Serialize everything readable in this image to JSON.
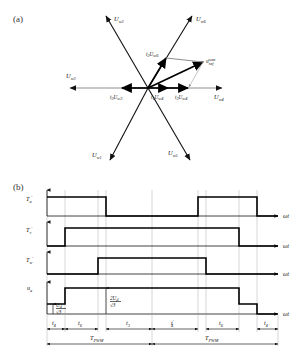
{
  "figure": {
    "panel_a_label": "(a)",
    "panel_b_label": "(b)"
  },
  "vector_diagram": {
    "axis_vectors": [
      {
        "id": "Uw1",
        "base": "U",
        "sub": "w1",
        "angle_deg": 240,
        "label": "U w1"
      },
      {
        "id": "Uw2",
        "base": "U",
        "sub": "w2",
        "angle_deg": 120,
        "label": "U w2"
      },
      {
        "id": "Uw3",
        "base": "U",
        "sub": "w3",
        "angle_deg": 180,
        "label": "U w3"
      },
      {
        "id": "Uw4",
        "base": "U",
        "sub": "w4",
        "angle_deg": 0,
        "label": "U w4"
      },
      {
        "id": "Uw5",
        "base": "U",
        "sub": "w5",
        "angle_deg": 300,
        "label": "U w5"
      },
      {
        "id": "Uw6",
        "base": "U",
        "sub": "w6",
        "angle_deg": 60,
        "label": "U w6"
      }
    ],
    "component_vectors": [
      {
        "id": "t2Uw6",
        "t": "t",
        "t_sub": "2",
        "u": "U",
        "u_sub": "w6",
        "label": "t2 Uw6"
      },
      {
        "id": "t1Uw4",
        "t": "t",
        "t_sub": "1",
        "u": "U",
        "u_sub": "w4",
        "label": "t1 Uw4"
      },
      {
        "id": "t3Uw4",
        "t": "t",
        "t_sub": "3",
        "u": "U",
        "u_sub": "w4",
        "label": "t3 Uw4"
      },
      {
        "id": "t3Uw3",
        "t": "t",
        "t_sub": "3",
        "u": "U",
        "u_sub": "w3",
        "label": "t3 Uw3"
      }
    ],
    "reference_vector": {
      "base": "u",
      "sub": "ref",
      "sup": "com",
      "label": "u ref com"
    }
  },
  "timing_diagram": {
    "signals": [
      {
        "name": "Tu",
        "base": "T",
        "sub": "u",
        "prime": "′",
        "axis_label": "ωt"
      },
      {
        "name": "Tv",
        "base": "T",
        "sub": "v",
        "prime": "′",
        "axis_label": "ωt"
      },
      {
        "name": "Tw",
        "base": "T",
        "sub": "w",
        "prime": "′",
        "axis_label": "ωt"
      },
      {
        "name": "ua",
        "base": "u",
        "sub": "a",
        "prime": "",
        "axis_label": "ωt"
      }
    ],
    "amplitude_annotations": [
      {
        "id": "level1",
        "numerator": "U",
        "num_sub": "d",
        "denominator": "√3",
        "label": "Ud/√3"
      },
      {
        "id": "level2",
        "numerator": "2U",
        "num_sub": "d",
        "denominator": "√3",
        "label": "2Ud/√3"
      }
    ],
    "time_intervals": [
      {
        "base": "t",
        "sub": "4",
        "sup": "",
        "label": "t4"
      },
      {
        "base": "t",
        "sub": "6",
        "sup": "",
        "label": "t6"
      },
      {
        "base": "t",
        "sub": "3",
        "sup": "",
        "label": "t3"
      },
      {
        "base": "t",
        "sub": "4",
        "sup": "′",
        "label": "t4'"
      },
      {
        "base": "t",
        "sub": "6",
        "sup": "",
        "label": "t6"
      },
      {
        "base": "t",
        "sub": "4",
        "sup": "",
        "label": "t4"
      }
    ],
    "periods": [
      {
        "base": "T",
        "sub": "PWM",
        "label": "TPWM"
      },
      {
        "base": "T",
        "sub": "PWM",
        "label": "TPWM"
      }
    ]
  },
  "colors": {
    "line": "#111111",
    "grid": "#b4b4b4",
    "guide": "#8d8d8d",
    "background": "#ffffff"
  }
}
